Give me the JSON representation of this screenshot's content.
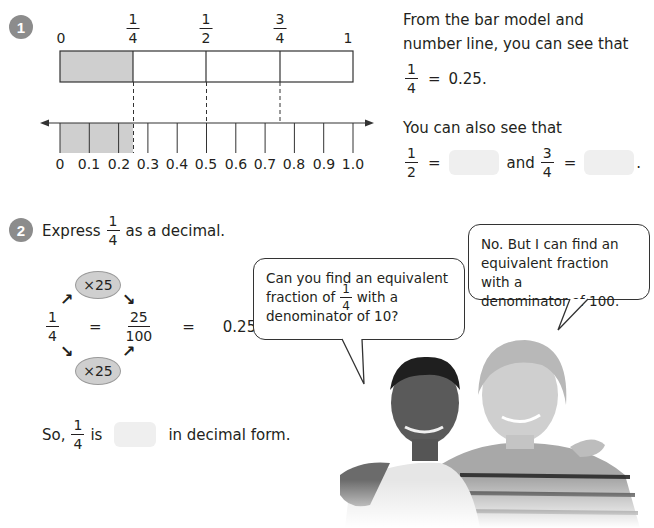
{
  "section1": {
    "number": "1",
    "bar_model": {
      "top_labels": [
        {
          "text": "0",
          "x": 60
        },
        {
          "num": "1",
          "den": "4",
          "x": 133
        },
        {
          "num": "1",
          "den": "2",
          "x": 206
        },
        {
          "num": "3",
          "den": "4",
          "x": 280
        },
        {
          "text": "1",
          "x": 350
        }
      ],
      "shaded_fraction": "1/4",
      "parts": 4,
      "shade_color": "#cfcfcf"
    },
    "number_line": {
      "labels": [
        "0",
        "0.1",
        "0.2",
        "0.3",
        "0.4",
        "0.5",
        "0.6",
        "0.7",
        "0.8",
        "0.9",
        "1.0"
      ],
      "shaded_until": 0.25,
      "dashed_markers": [
        0.25,
        0.5,
        0.75
      ]
    },
    "explanation": {
      "line1": "From the bar model and",
      "line2": "number line, you can see that",
      "eq1": {
        "num": "1",
        "den": "4",
        "equals": "=",
        "value": "0.25."
      },
      "line3": "You can also see that",
      "eq2": {
        "num_a": "1",
        "den_a": "2",
        "equals": "=",
        "and": "and",
        "num_b": "3",
        "den_b": "4",
        "period": "."
      }
    }
  },
  "section2": {
    "number": "2",
    "prompt_before": "Express",
    "prompt_num": "1",
    "prompt_den": "4",
    "prompt_after": "as a decimal.",
    "work": {
      "frac_num": "1",
      "frac_den": "4",
      "eq": "=",
      "frac2_num": "25",
      "frac2_den": "100",
      "eq2": "=",
      "result": "0.25",
      "multiplier_top": "×25",
      "multiplier_bottom": "×25"
    },
    "conclusion": {
      "before": "So,",
      "num": "1",
      "den": "4",
      "is": "is",
      "after": "in decimal form."
    }
  },
  "bubbles": {
    "left": {
      "line1": "Can you find an equivalent",
      "line2_before": "fraction of",
      "num": "1",
      "den": "4",
      "line2_after": "with a",
      "line3": "denominator of 10?"
    },
    "right": {
      "line1": "No. But I can find an",
      "line2": "equivalent fraction with a",
      "line3": "denominator of 100."
    }
  },
  "photo": {
    "description": "two smiling boys, arms around each other"
  }
}
